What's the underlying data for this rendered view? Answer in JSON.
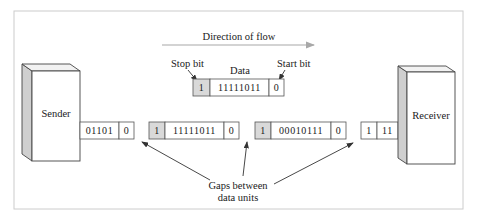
{
  "diagram": {
    "direction_label": "Direction of flow",
    "sender_label": "Sender",
    "receiver_label": "Receiver",
    "legend_unit": {
      "stop_bit_label": "Stop bit",
      "data_label": "Data",
      "start_bit_label": "Start bit",
      "stop_bit": "1",
      "data_bits": "11111011",
      "start_bit": "0"
    },
    "units": [
      {
        "data_bits": "01101",
        "start_bit": "0",
        "partial": true
      },
      {
        "stop_bit": "1",
        "data_bits": "11111011",
        "start_bit": "0"
      },
      {
        "stop_bit": "1",
        "data_bits": "00010111",
        "start_bit": "0"
      },
      {
        "stop_bit": "1",
        "data_bits": "11",
        "partial": true
      }
    ],
    "gaps_label_line1": "Gaps between",
    "gaps_label_line2": "data units",
    "colors": {
      "stop_bit_fill": "#d9d9d9",
      "device_side": "#cfcfcf",
      "arrow": "#a8a8a8",
      "frame": "#cccccc"
    }
  }
}
